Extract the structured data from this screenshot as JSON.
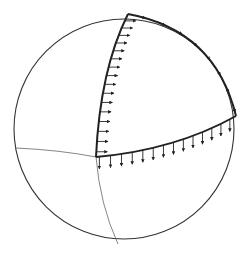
{
  "diagram": {
    "colors": {
      "stroke": "#222222",
      "thin_stroke": "#555555",
      "background": "#ffffff"
    },
    "sphere": {
      "cx": 124,
      "cy": 129,
      "r": 110
    },
    "vertices": {
      "top": [
        128,
        14
      ],
      "corner": [
        96,
        157
      ],
      "right": [
        236,
        116
      ]
    },
    "edges": [
      {
        "name": "left-meridian",
        "arrows": 16,
        "arrow_direction": "right"
      },
      {
        "name": "equator-arc",
        "arrows": 14,
        "arrow_direction": "down"
      },
      {
        "name": "right-arc",
        "arrows": 8,
        "arrow_direction": "along-edge"
      }
    ]
  }
}
